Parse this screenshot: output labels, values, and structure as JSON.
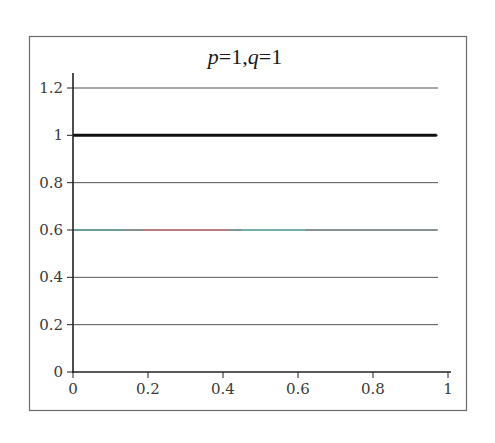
{
  "chart_data": {
    "type": "line",
    "title": "p=1,q=1",
    "title_parts": [
      {
        "text": "p",
        "italic": true
      },
      {
        "text": "=1,",
        "italic": false
      },
      {
        "text": "q",
        "italic": true
      },
      {
        "text": "=1",
        "italic": false
      }
    ],
    "xlabel": "",
    "ylabel": "",
    "xlim": [
      0,
      1
    ],
    "ylim": [
      0,
      1.2
    ],
    "x_ticks": [
      0,
      0.2,
      0.4,
      0.6,
      0.8,
      1
    ],
    "x_tick_labels": [
      "0",
      "0.2",
      "0.4",
      "0.6",
      "0.8",
      "1"
    ],
    "y_ticks": [
      0,
      0.2,
      0.4,
      0.6,
      0.8,
      1,
      1.2
    ],
    "y_tick_labels": [
      "0",
      "0.2",
      "0.4",
      "0.6",
      "0.8",
      "1",
      "1.2"
    ],
    "grid": {
      "horizontal": true,
      "vertical": false
    },
    "legend": null,
    "series": [
      {
        "name": "upper",
        "x": [
          0,
          0.97
        ],
        "values": [
          1.0,
          1.0
        ],
        "color": "#111111",
        "width": 3
      },
      {
        "name": "lower",
        "x": [
          0,
          0.97
        ],
        "values": [
          0.6,
          0.6
        ],
        "color": "#7a8a88",
        "width": 1.4,
        "segments": [
          {
            "x0": 0.0,
            "x1": 0.13,
            "color": "#5aa8a0"
          },
          {
            "x0": 0.19,
            "x1": 0.41,
            "color": "#e46a76"
          },
          {
            "x0": 0.45,
            "x1": 0.62,
            "color": "#5cc8c0"
          }
        ]
      }
    ]
  },
  "colors": {
    "frame": "#6b6b6b",
    "axis": "#222222",
    "grid": "#555555",
    "text": "#3a3a3a"
  }
}
